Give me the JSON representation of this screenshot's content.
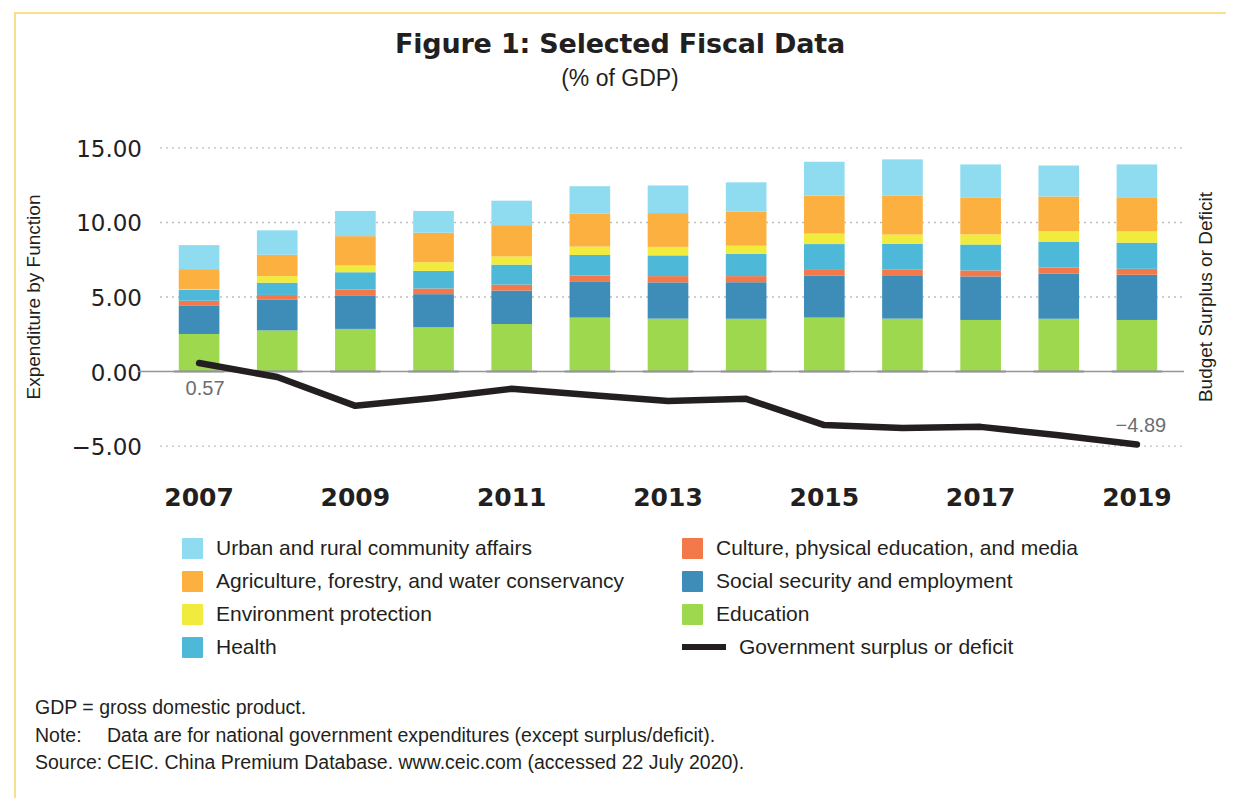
{
  "figure": {
    "title": "Figure 1: Selected Fiscal Data",
    "subtitle": "(% of GDP)"
  },
  "axes": {
    "left_label": "Expenditure by Function",
    "right_label": "Budget Surplus or Deficit",
    "y_ticks": [
      "15.00",
      "10.00",
      "5.00",
      "0.00",
      "-5.00"
    ],
    "x_ticks": [
      "2007",
      "2009",
      "2011",
      "2013",
      "2015",
      "2017",
      "2019"
    ]
  },
  "legend": {
    "items": [
      {
        "label": "Urban and rural community affairs",
        "color": "#8fdcf0",
        "type": "swatch"
      },
      {
        "label": "Culture, physical education, and media",
        "color": "#f4794a",
        "type": "swatch"
      },
      {
        "label": "Agriculture, forestry, and water conservancy",
        "color": "#fbb040",
        "type": "swatch"
      },
      {
        "label": "Social security and employment",
        "color": "#3d8db8",
        "type": "swatch"
      },
      {
        "label": "Environment protection",
        "color": "#f0eb3c",
        "type": "swatch"
      },
      {
        "label": "Education",
        "color": "#9ed84f",
        "type": "swatch"
      },
      {
        "label": "Health",
        "color": "#4db8d8",
        "type": "swatch"
      },
      {
        "label": "Government surplus or deficit",
        "color": "#231f20",
        "type": "line"
      }
    ]
  },
  "notes": {
    "abbrev": "GDP = gross domestic product.",
    "note_key": "Note:",
    "note_val": "Data are for national government expenditures (except surplus/deficit).",
    "source_key": "Source:",
    "source_val": "CEIC. China Premium Database. www.ceic.com (accessed 22 July 2020)."
  },
  "chart_data": {
    "type": "bar",
    "title": "Figure 1: Selected Fiscal Data",
    "subtitle": "(% of GDP)",
    "xlabel": "",
    "ylabel": "Expenditure by Function",
    "y2label": "Budget Surplus or Deficit",
    "ylim": [
      -6.5,
      16.0
    ],
    "grid": true,
    "legend_position": "bottom",
    "categories": [
      "2007",
      "2008",
      "2009",
      "2010",
      "2011",
      "2012",
      "2013",
      "2014",
      "2015",
      "2016",
      "2017",
      "2018",
      "2019"
    ],
    "stacked": true,
    "series": [
      {
        "name": "Education",
        "color": "#9ed84f",
        "values": [
          2.52,
          2.76,
          2.86,
          2.97,
          3.19,
          3.62,
          3.55,
          3.54,
          3.62,
          3.55,
          3.46,
          3.54,
          3.46
        ]
      },
      {
        "name": "Social security and employment",
        "color": "#3d8db8",
        "values": [
          1.92,
          2.05,
          2.25,
          2.22,
          2.24,
          2.39,
          2.43,
          2.45,
          2.8,
          2.86,
          2.92,
          3.04,
          3.03
        ]
      },
      {
        "name": "Culture, physical education, and media",
        "color": "#f4794a",
        "values": [
          0.31,
          0.33,
          0.39,
          0.38,
          0.4,
          0.42,
          0.42,
          0.41,
          0.45,
          0.42,
          0.4,
          0.39,
          0.4
        ]
      },
      {
        "name": "Health",
        "color": "#4db8d8",
        "values": [
          0.75,
          0.82,
          1.16,
          1.18,
          1.34,
          1.39,
          1.39,
          1.49,
          1.68,
          1.74,
          1.74,
          1.72,
          1.75
        ]
      },
      {
        "name": "Environment protection",
        "color": "#f0eb3c",
        "values": [
          0.04,
          0.44,
          0.45,
          0.58,
          0.55,
          0.56,
          0.57,
          0.55,
          0.7,
          0.62,
          0.68,
          0.72,
          0.76
        ]
      },
      {
        "name": "Agriculture, forestry, and water conservancy",
        "color": "#fbb040",
        "values": [
          1.33,
          1.43,
          1.97,
          1.98,
          2.1,
          2.22,
          2.27,
          2.29,
          2.55,
          2.6,
          2.45,
          2.33,
          2.29
        ]
      },
      {
        "name": "Urban and rural community affairs",
        "color": "#8fdcf0",
        "values": [
          1.61,
          1.64,
          1.69,
          1.46,
          1.64,
          1.83,
          1.85,
          1.96,
          2.27,
          2.44,
          2.24,
          2.08,
          2.2
        ]
      }
    ],
    "line_series": {
      "name": "Government surplus or deficit",
      "color": "#231f20",
      "values": [
        0.57,
        -0.37,
        -2.3,
        -1.78,
        -1.16,
        -1.58,
        -1.97,
        -1.83,
        -3.59,
        -3.79,
        -3.71,
        -4.27,
        -4.89
      ],
      "labels": {
        "first": "0.57",
        "last": "-4.89"
      }
    }
  }
}
